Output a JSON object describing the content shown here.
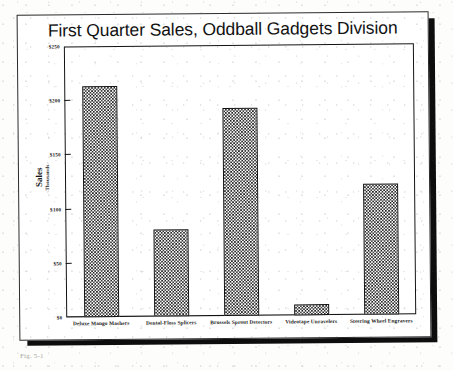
{
  "page": {
    "caption_fragment": "Fig. 5-1"
  },
  "chart_data": {
    "type": "bar",
    "title": "First Quarter Sales, Oddball Gadgets Division",
    "xlabel": "",
    "ylabel": "Sales",
    "ylabel_sub": "Thousands",
    "categories": [
      "Deluxe Mango Mashers",
      "Dental-Floss Splicers",
      "Brussels Sprout Detectors",
      "Videotape Unravelers",
      "Steering Wheel Engravers"
    ],
    "values": [
      213,
      80,
      192,
      10,
      121
    ],
    "ylim": [
      0,
      250
    ],
    "yticks": [
      0,
      50,
      100,
      150,
      200,
      250
    ],
    "ytick_labels": [
      "$0",
      "$50",
      "$100",
      "$150",
      "$200",
      "$250"
    ],
    "grid": false,
    "legend": false,
    "bar_fill": "#1b1b1b",
    "bar_edge": "#111111",
    "axis_color": "#131313",
    "background": "#ffffff"
  }
}
